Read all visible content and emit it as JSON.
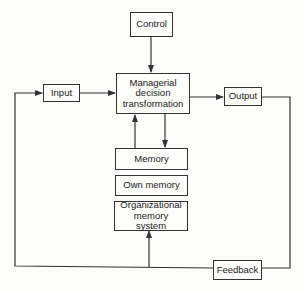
{
  "diagram": {
    "nodes": {
      "control": {
        "label": "Control"
      },
      "managerial": {
        "label": "Managerial decision transformation"
      },
      "input": {
        "label": "Input"
      },
      "output": {
        "label": "Output"
      },
      "memory": {
        "label": "Memory"
      },
      "own_memory": {
        "label": "Own memory"
      },
      "org_memory": {
        "label": "Organizational memory system"
      },
      "feedback": {
        "label": "Feedback"
      }
    },
    "edges": [
      {
        "from": "Control",
        "to": "Managerial decision transformation"
      },
      {
        "from": "Input",
        "to": "Managerial decision transformation"
      },
      {
        "from": "Managerial decision transformation",
        "to": "Output"
      },
      {
        "from": "Managerial decision transformation",
        "to": "Memory"
      },
      {
        "from": "Memory",
        "to": "Managerial decision transformation"
      },
      {
        "from": "Output",
        "to": "Feedback"
      },
      {
        "from": "Feedback",
        "to": "Input"
      },
      {
        "from": "Feedback",
        "to": "Organizational memory system"
      }
    ],
    "colors": {
      "line": "#333333",
      "background": "#fdfdfb"
    }
  }
}
